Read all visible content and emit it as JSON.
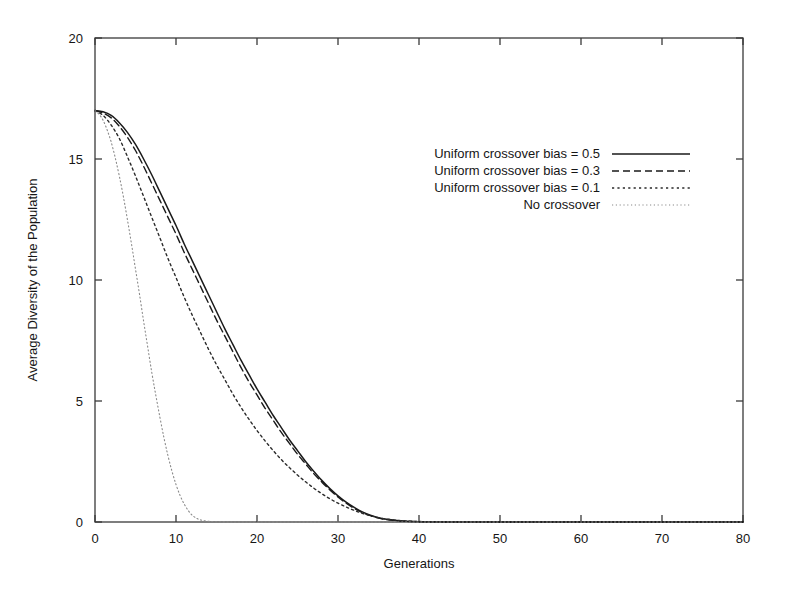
{
  "chart_data": {
    "type": "line",
    "title": "",
    "xlabel": "Generations",
    "ylabel": "Average Diversity of the Population",
    "xlim": [
      0,
      80
    ],
    "ylim": [
      0,
      20
    ],
    "xticks": [
      0,
      10,
      20,
      30,
      40,
      50,
      60,
      70,
      80
    ],
    "yticks": [
      0,
      5,
      10,
      15,
      20
    ],
    "xticklabels": [
      "0",
      "10",
      "20",
      "30",
      "40",
      "50",
      "60",
      "70",
      "80"
    ],
    "yticklabels": [
      "0",
      "5",
      "10",
      "15",
      "20"
    ],
    "grid": false,
    "legend_position": "upper-center-right",
    "series": [
      {
        "name": "Uniform crossover bias = 0.5",
        "style": "solid",
        "color": "#1a1a1a",
        "x": [
          0,
          1,
          2,
          3,
          4,
          5,
          6,
          7,
          8,
          9,
          10,
          11,
          12,
          13,
          14,
          15,
          16,
          17,
          18,
          19,
          20,
          21,
          22,
          23,
          24,
          25,
          26,
          27,
          28,
          29,
          30,
          31,
          32,
          33,
          34,
          35,
          36,
          38,
          40,
          45,
          50,
          60,
          70,
          80
        ],
        "y": [
          17.0,
          16.95,
          16.8,
          16.5,
          16.1,
          15.6,
          15.0,
          14.35,
          13.65,
          12.95,
          12.25,
          11.5,
          10.8,
          10.1,
          9.4,
          8.7,
          8.0,
          7.35,
          6.7,
          6.1,
          5.5,
          4.95,
          4.4,
          3.9,
          3.4,
          2.95,
          2.5,
          2.1,
          1.72,
          1.38,
          1.08,
          0.82,
          0.6,
          0.42,
          0.28,
          0.18,
          0.11,
          0.04,
          0.015,
          0.0,
          0.0,
          0.0,
          0.0,
          0.0
        ]
      },
      {
        "name": "Uniform crossover bias = 0.3",
        "style": "dashed",
        "color": "#1a1a1a",
        "x": [
          0,
          1,
          2,
          3,
          4,
          5,
          6,
          7,
          8,
          9,
          10,
          11,
          12,
          13,
          14,
          15,
          16,
          17,
          18,
          19,
          20,
          21,
          22,
          23,
          24,
          25,
          26,
          27,
          28,
          29,
          30,
          31,
          32,
          33,
          34,
          35,
          36,
          38,
          40,
          45,
          50,
          60,
          70,
          80
        ],
        "y": [
          17.0,
          16.9,
          16.7,
          16.35,
          15.9,
          15.35,
          14.7,
          14.0,
          13.3,
          12.6,
          11.9,
          11.15,
          10.45,
          9.75,
          9.05,
          8.35,
          7.7,
          7.05,
          6.4,
          5.8,
          5.25,
          4.7,
          4.2,
          3.7,
          3.25,
          2.8,
          2.4,
          2.0,
          1.65,
          1.32,
          1.03,
          0.78,
          0.56,
          0.39,
          0.26,
          0.16,
          0.1,
          0.035,
          0.012,
          0.0,
          0.0,
          0.0,
          0.0,
          0.0
        ]
      },
      {
        "name": "Uniform crossover bias = 0.1",
        "style": "dotted",
        "color": "#2a2a2a",
        "x": [
          0,
          1,
          2,
          3,
          4,
          5,
          6,
          7,
          8,
          9,
          10,
          11,
          12,
          13,
          14,
          15,
          16,
          17,
          18,
          19,
          20,
          21,
          22,
          23,
          24,
          25,
          26,
          27,
          28,
          29,
          30,
          31,
          32,
          33,
          34,
          35,
          36,
          38,
          40,
          45,
          50,
          60,
          70,
          80
        ],
        "y": [
          17.0,
          16.8,
          16.4,
          15.85,
          15.1,
          14.3,
          13.45,
          12.6,
          11.75,
          10.9,
          10.1,
          9.3,
          8.55,
          7.85,
          7.15,
          6.5,
          5.9,
          5.3,
          4.75,
          4.25,
          3.78,
          3.35,
          2.95,
          2.58,
          2.25,
          1.94,
          1.66,
          1.4,
          1.17,
          0.96,
          0.78,
          0.62,
          0.48,
          0.36,
          0.26,
          0.18,
          0.12,
          0.05,
          0.02,
          0.0,
          0.0,
          0.0,
          0.0,
          0.0
        ]
      },
      {
        "name": "No crossover",
        "style": "fine-dotted",
        "color": "#8a8a8a",
        "x": [
          0,
          0.5,
          1,
          1.5,
          2,
          2.5,
          3,
          3.5,
          4,
          4.5,
          5,
          5.5,
          6,
          6.5,
          7,
          7.5,
          8,
          8.5,
          9,
          9.5,
          10,
          10.5,
          11,
          11.5,
          12,
          12.5,
          13,
          14,
          16,
          20,
          30,
          40,
          60,
          80
        ],
        "y": [
          17.0,
          16.85,
          16.6,
          16.2,
          15.7,
          15.05,
          14.3,
          13.45,
          12.5,
          11.5,
          10.45,
          9.4,
          8.3,
          7.25,
          6.2,
          5.25,
          4.35,
          3.5,
          2.75,
          2.1,
          1.55,
          1.1,
          0.75,
          0.48,
          0.28,
          0.16,
          0.09,
          0.03,
          0.005,
          0.0,
          0.0,
          0.0,
          0.0,
          0.0
        ]
      }
    ]
  },
  "legend": {
    "entries": [
      {
        "label": "Uniform crossover bias = 0.5",
        "style": "solid"
      },
      {
        "label": "Uniform crossover bias = 0.3",
        "style": "dashed"
      },
      {
        "label": "Uniform crossover bias = 0.1",
        "style": "dotted"
      },
      {
        "label": "No crossover",
        "style": "fine-dotted"
      }
    ]
  },
  "colors": {
    "frame": "#3a3a3a",
    "text": "#161616",
    "solid": "#1a1a1a",
    "dashed": "#1a1a1a",
    "dotted": "#2a2a2a",
    "fine_dotted": "#8a8a8a",
    "background": "#ffffff"
  }
}
